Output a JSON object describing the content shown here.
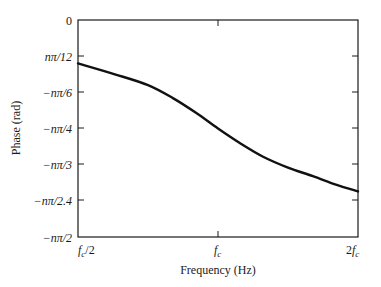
{
  "chart_data": {
    "type": "line",
    "title": "",
    "xlabel": "Frequency (Hz)",
    "ylabel": "Phase (rad)",
    "x_tick_labels": [
      "f_c/2",
      "f_c",
      "2f_c"
    ],
    "x_tick_positions_relative_to_fc": [
      0.5,
      1,
      2
    ],
    "x_scale": "log",
    "y_tick_labels": [
      "0",
      "nπ/12",
      "−nπ/6",
      "−nπ/4",
      "−nπ/3",
      "−nπ/2.4",
      "−nπ/2"
    ],
    "y_tick_values_in_units_of_n_pi": [
      0,
      -0.0833,
      -0.1667,
      -0.25,
      -0.3333,
      -0.4167,
      -0.5
    ],
    "ylim_in_units_of_n_pi": [
      -0.5,
      0
    ],
    "grid": false,
    "legend": null,
    "series": [
      {
        "name": "Phase",
        "x_relative_to_fc": [
          0.5,
          0.6,
          0.707,
          0.8,
          0.9,
          1.0,
          1.12,
          1.25,
          1.414,
          1.6,
          1.8,
          2.0
        ],
        "y_in_units_of_n_pi": [
          -0.1,
          -0.125,
          -0.15,
          -0.18,
          -0.215,
          -0.25,
          -0.285,
          -0.315,
          -0.34,
          -0.36,
          -0.38,
          -0.395
        ]
      }
    ]
  },
  "labels": {
    "xlabel": "Frequency (Hz)",
    "ylabel": "Phase (rad)",
    "y_ticks": [
      "0",
      "nπ/12",
      "−nπ/6",
      "−nπ/4",
      "−nπ/3",
      "−nπ/2.4",
      "−nπ/2"
    ],
    "x_ticks": {
      "left": {
        "main": "f",
        "sub": "c",
        "suffix": "/2",
        "prefix": ""
      },
      "mid": {
        "main": "f",
        "sub": "c",
        "suffix": "",
        "prefix": ""
      },
      "right": {
        "main": "f",
        "sub": "c",
        "suffix": "",
        "prefix": "2"
      }
    }
  }
}
